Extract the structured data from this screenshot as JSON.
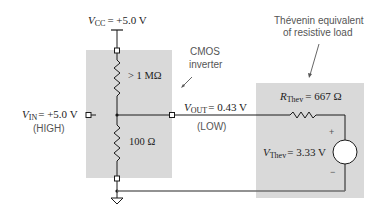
{
  "diagram": {
    "colors": {
      "box_fill": "#d9d9d9",
      "wire": "#1a1a1a",
      "bottom_wire": "#6e6e6e",
      "annotation_text": "#5a5a5a",
      "label_text": "#222222"
    },
    "vcc": {
      "symbol": "V",
      "subscript": "CC",
      "value": "= +5.0 V"
    },
    "vin": {
      "symbol": "V",
      "subscript": "IN",
      "value": "= +5.0 V",
      "state": "(HIGH)"
    },
    "vout": {
      "symbol": "V",
      "subscript": "OUT",
      "value": "= 0.43 V",
      "state": "(LOW)"
    },
    "pull_up_resistor": {
      "label": "> 1 MΩ"
    },
    "pull_down_resistor": {
      "label": "100 Ω"
    },
    "cmos_annotation": {
      "line1": "CMOS",
      "line2": "inverter"
    },
    "thevenin_annotation": {
      "line1": "Thévenin equivalent",
      "line2": "of resistive load"
    },
    "r_thev": {
      "symbol": "R",
      "subscript": "Thev",
      "value": "= 667 Ω"
    },
    "v_thev": {
      "symbol": "V",
      "subscript": "Thev",
      "value": "= 3.33 V",
      "plus": "+",
      "minus": "−"
    }
  }
}
